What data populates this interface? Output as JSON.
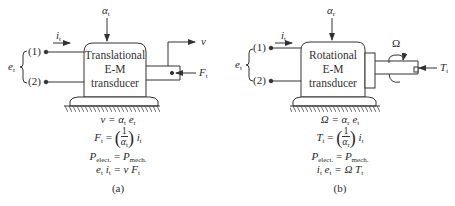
{
  "figure": {
    "panel_a": {
      "caption": "(a)",
      "box_lines": [
        "Translational",
        "E-M",
        "transducer"
      ],
      "coupling_label": "α",
      "coupling_sub": "t",
      "terminal_1": "(1)",
      "terminal_2": "(2)",
      "voltage_label": "e",
      "voltage_sub": "t",
      "current_label": "i",
      "current_sub": "t",
      "output_label": "v",
      "force_label": "F",
      "force_sub": "t",
      "equations": {
        "eq1": "v = α",
        "eq1_sub": "t",
        "eq1_tail": " e",
        "eq1_tail_sub": "t",
        "eq2_lhs": "F",
        "eq2_lhs_sub": "t",
        "eq2_num": "1",
        "eq2_den": "α",
        "eq2_den_sub": "t",
        "eq2_tail": "i",
        "eq2_tail_sub": "t",
        "eq3_lhs": "P",
        "eq3_lhs_sub": "elect.",
        "eq3_rhs": "P",
        "eq3_rhs_sub": "mech.",
        "eq4": "e",
        "eq4_a_sub": "t",
        "eq4_b": " i",
        "eq4_b_sub": "t",
        "eq4_c": " = v F",
        "eq4_c_sub": "t"
      }
    },
    "panel_b": {
      "caption": "(b)",
      "box_lines": [
        "Rotational",
        "E-M",
        "transducer"
      ],
      "coupling_label": "α",
      "coupling_sub": "r",
      "terminal_1": "(1)",
      "terminal_2": "(2)",
      "voltage_label": "e",
      "voltage_sub": "t",
      "current_label": "i",
      "current_sub": "t",
      "rotation_label": "Ω",
      "torque_label": "T",
      "torque_sub": "t",
      "equations": {
        "eq1": "Ω = α",
        "eq1_sub": "r",
        "eq1_tail": " e",
        "eq1_tail_sub": "t",
        "eq2_lhs": "T",
        "eq2_lhs_sub": "t",
        "eq2_num": "1",
        "eq2_den": "α",
        "eq2_den_sub": "r",
        "eq2_tail": "i",
        "eq2_tail_sub": "t",
        "eq3_lhs": "P",
        "eq3_lhs_sub": "elect.",
        "eq3_rhs": "P",
        "eq3_rhs_sub": "mech.",
        "eq4": "i",
        "eq4_a_sub": "t",
        "eq4_b": " e",
        "eq4_b_sub": "t",
        "eq4_c": " = Ω T",
        "eq4_c_sub": "t"
      }
    }
  }
}
